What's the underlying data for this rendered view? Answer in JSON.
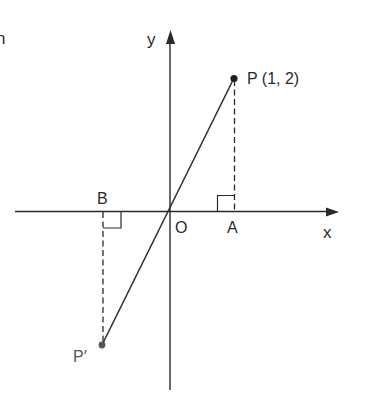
{
  "diagram": {
    "type": "coordinate-geometry",
    "cropped_text": "n",
    "axes": {
      "x_label": "x",
      "y_label": "y",
      "origin_label": "O"
    },
    "points": {
      "P": {
        "label": "P (1, 2)",
        "x": 1,
        "y": 2
      },
      "P_prime": {
        "label": "P′"
      },
      "A": {
        "label": "A"
      },
      "B": {
        "label": "B"
      }
    },
    "segments": [
      {
        "from": "P",
        "to": "P′",
        "style": "solid",
        "through": "O"
      },
      {
        "from": "P",
        "to": "A",
        "style": "dashed"
      },
      {
        "from": "P′",
        "to": "B",
        "style": "dashed"
      }
    ],
    "right_angles": [
      "A",
      "B"
    ],
    "colors": {
      "ink": "#2a2a2a",
      "background": "#ffffff"
    }
  }
}
